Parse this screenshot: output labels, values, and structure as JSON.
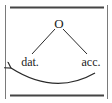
{
  "diagram": {
    "root_label": "O",
    "left_label": "dat.",
    "right_label": "acc.",
    "arrow": {
      "from": "acc.",
      "to": "dat.",
      "direction": "right-to-left"
    },
    "colors": {
      "stroke": "#2a2a2a",
      "frame_rule": "#444444",
      "text": "#222222",
      "background": "#ffffff"
    }
  }
}
